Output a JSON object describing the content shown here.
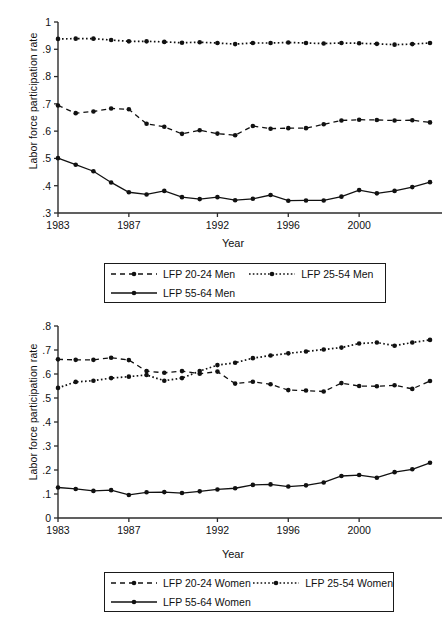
{
  "figure": {
    "ylabel": "Labor force participation rate",
    "xlabel": "Year"
  },
  "panels": [
    {
      "id": "men",
      "legend": [
        {
          "label": "LFP 20-24 Men",
          "style": "dashed"
        },
        {
          "label": "LFP 25-54 Men",
          "style": "dotted"
        },
        {
          "label": "LFP 55-64 Men",
          "style": "solid"
        }
      ]
    },
    {
      "id": "women",
      "legend": [
        {
          "label": "LFP 20-24 Women",
          "style": "dashed"
        },
        {
          "label": "LFP 25-54 Women",
          "style": "dotted"
        },
        {
          "label": "LFP 55-64 Women",
          "style": "solid"
        }
      ]
    }
  ],
  "chart_data": [
    {
      "type": "line",
      "title": "",
      "xlabel": "Year",
      "ylabel": "Labor force participation rate",
      "x": [
        1983,
        1984,
        1985,
        1986,
        1987,
        1988,
        1989,
        1990,
        1991,
        1992,
        1993,
        1994,
        1995,
        1996,
        1997,
        1998,
        1999,
        2000,
        2001,
        2002,
        2003,
        2004
      ],
      "xticks": [
        1983,
        1987,
        1992,
        1996,
        2000
      ],
      "xlim": [
        1983,
        2004
      ],
      "ylim": [
        0.3,
        1.0
      ],
      "yticks": [
        0.3,
        0.4,
        0.5,
        0.6,
        0.7,
        0.8,
        0.9,
        1.0
      ],
      "yticklabels": [
        ".3",
        ".4",
        ".5",
        ".6",
        ".7",
        ".8",
        ".9",
        "1"
      ],
      "grid": false,
      "legend_position": "below",
      "series": [
        {
          "name": "LFP 20-24 Men",
          "style": "dashed",
          "values": [
            0.694,
            0.666,
            0.672,
            0.683,
            0.68,
            0.627,
            0.616,
            0.59,
            0.603,
            0.591,
            0.585,
            0.619,
            0.609,
            0.611,
            0.611,
            0.625,
            0.639,
            0.642,
            0.641,
            0.639,
            0.64,
            0.632
          ]
        },
        {
          "name": "LFP 25-54 Men",
          "style": "dotted",
          "values": [
            0.938,
            0.939,
            0.939,
            0.934,
            0.929,
            0.929,
            0.927,
            0.924,
            0.926,
            0.923,
            0.919,
            0.923,
            0.923,
            0.925,
            0.923,
            0.921,
            0.923,
            0.922,
            0.92,
            0.917,
            0.919,
            0.923
          ]
        },
        {
          "name": "LFP 55-64 Men",
          "style": "solid",
          "values": [
            0.501,
            0.477,
            0.453,
            0.412,
            0.376,
            0.368,
            0.381,
            0.358,
            0.351,
            0.358,
            0.347,
            0.352,
            0.366,
            0.345,
            0.346,
            0.346,
            0.36,
            0.384,
            0.372,
            0.381,
            0.395,
            0.413
          ]
        }
      ]
    },
    {
      "type": "line",
      "title": "",
      "xlabel": "Year",
      "ylabel": "Labor force participation rate",
      "x": [
        1983,
        1984,
        1985,
        1986,
        1987,
        1988,
        1989,
        1990,
        1991,
        1992,
        1993,
        1994,
        1995,
        1996,
        1997,
        1998,
        1999,
        2000,
        2001,
        2002,
        2003,
        2004
      ],
      "xticks": [
        1983,
        1987,
        1992,
        1996,
        2000
      ],
      "xlim": [
        1983,
        2004
      ],
      "ylim": [
        0.0,
        0.8
      ],
      "yticks": [
        0.0,
        0.1,
        0.2,
        0.3,
        0.4,
        0.5,
        0.6,
        0.7,
        0.8
      ],
      "yticklabels": [
        "0",
        ".1",
        ".2",
        ".3",
        ".4",
        ".5",
        ".6",
        ".7",
        ".8"
      ],
      "grid": false,
      "legend_position": "below",
      "series": [
        {
          "name": "LFP 20-24 Women",
          "style": "dashed",
          "values": [
            0.661,
            0.659,
            0.659,
            0.668,
            0.658,
            0.612,
            0.605,
            0.612,
            0.601,
            0.61,
            0.56,
            0.568,
            0.557,
            0.533,
            0.531,
            0.527,
            0.562,
            0.55,
            0.549,
            0.553,
            0.538,
            0.571
          ]
        },
        {
          "name": "LFP 25-54 Women",
          "style": "dotted",
          "values": [
            0.542,
            0.567,
            0.572,
            0.583,
            0.589,
            0.596,
            0.572,
            0.583,
            0.612,
            0.637,
            0.647,
            0.666,
            0.677,
            0.686,
            0.694,
            0.702,
            0.71,
            0.727,
            0.731,
            0.718,
            0.731,
            0.742
          ]
        },
        {
          "name": "LFP 55-64 Women",
          "style": "solid",
          "values": [
            0.127,
            0.121,
            0.113,
            0.116,
            0.096,
            0.107,
            0.108,
            0.104,
            0.111,
            0.119,
            0.124,
            0.138,
            0.14,
            0.131,
            0.136,
            0.148,
            0.175,
            0.179,
            0.168,
            0.191,
            0.203,
            0.23
          ]
        }
      ]
    }
  ]
}
